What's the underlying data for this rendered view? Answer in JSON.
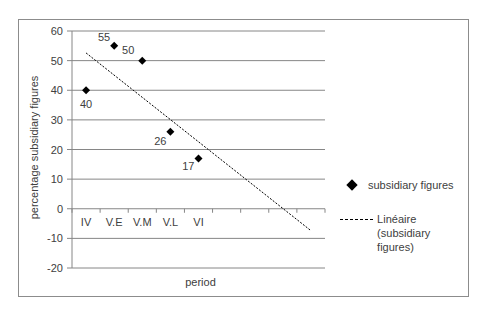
{
  "chart_data": {
    "type": "scatter",
    "title": "",
    "xlabel": "period",
    "ylabel": "percentage subsidiary figures",
    "categories": [
      "IV",
      "V.E",
      "V.M",
      "V.L",
      "VI"
    ],
    "series": [
      {
        "name": "subsidiary figures",
        "marker": "diamond",
        "color": "#000000",
        "x": [
          1,
          2,
          3,
          4,
          5
        ],
        "values": [
          40,
          55,
          50,
          26,
          17
        ],
        "labels": [
          "40",
          "55",
          "50",
          "26",
          "17"
        ]
      },
      {
        "name": "Linéaire (subsidiary figures)",
        "type": "trendline-linear",
        "style": "dotted",
        "color": "#000000",
        "x": [
          1,
          9
        ],
        "values": [
          52.6,
          -7.4
        ]
      }
    ],
    "ylim": [
      -20,
      60
    ],
    "yticks": [
      60,
      50,
      40,
      30,
      20,
      10,
      0,
      -10,
      -20
    ],
    "ytick_labels": [
      "60",
      "50",
      "40",
      "30",
      "20",
      "10",
      "0",
      "-10",
      "-20"
    ],
    "x_slots": 9,
    "grid": true,
    "legend_position": "right"
  },
  "legend": {
    "items": [
      {
        "label": "subsidiary figures"
      },
      {
        "label_line1": "Linéaire (subsidiary",
        "label_line2": "figures)"
      }
    ]
  },
  "axes": {
    "xlabel": "period",
    "ylabel": "percentage subsidiary figures"
  }
}
